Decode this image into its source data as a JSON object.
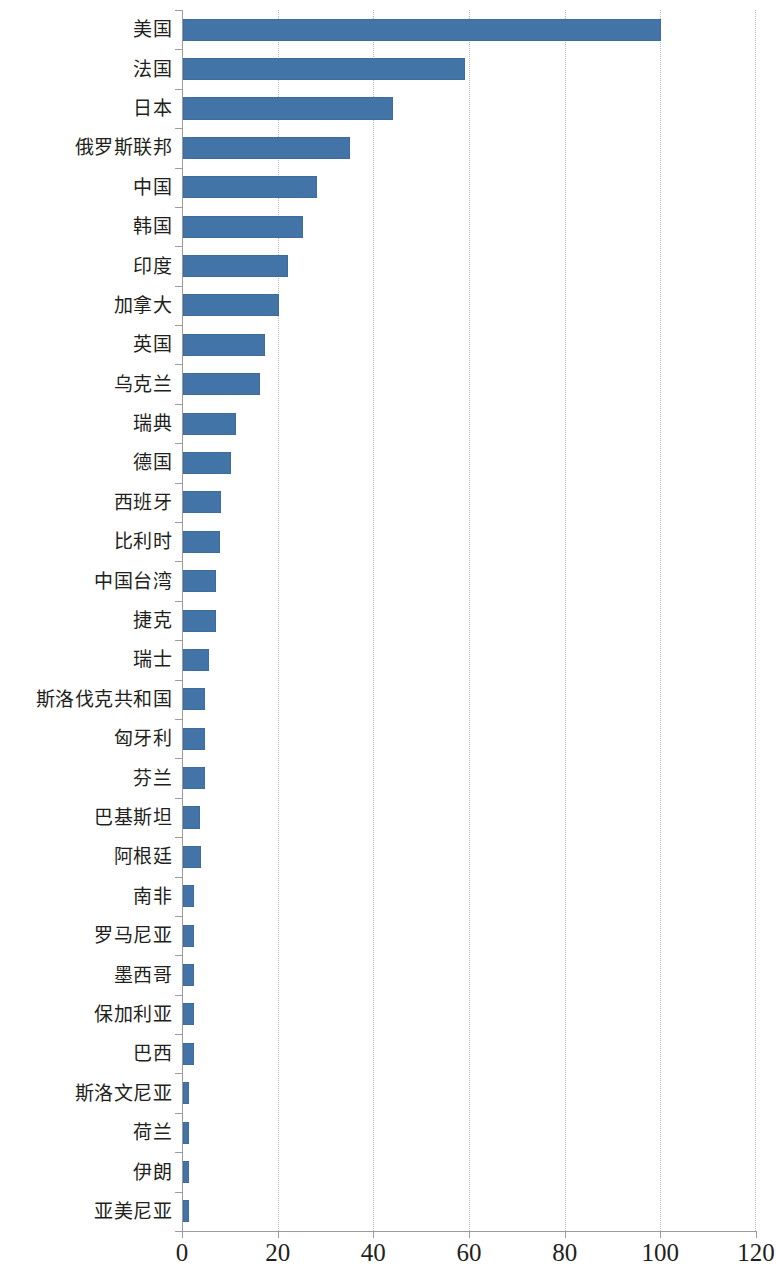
{
  "chart_data": {
    "type": "bar",
    "orientation": "horizontal",
    "title": "",
    "subtitle": "",
    "xlabel": "",
    "ylabel": "",
    "xlim": [
      0,
      120
    ],
    "xticks": [
      0,
      20,
      40,
      60,
      80,
      100,
      120
    ],
    "xtick_labels": [
      "0",
      "20",
      "40",
      "60",
      "80",
      "100",
      "120"
    ],
    "grid": "vertical-dotted",
    "legend": "none",
    "series_color": "#4274a7",
    "categories": [
      "美国",
      "法国",
      "日本",
      "俄罗斯联邦",
      "中国",
      "韩国",
      "印度",
      "加拿大",
      "英国",
      "乌克兰",
      "瑞典",
      "德国",
      "西班牙",
      "比利时",
      "中国台湾",
      "捷克",
      "瑞士",
      "斯洛伐克共和国",
      "匈牙利",
      "芬兰",
      "巴基斯坦",
      "阿根廷",
      "南非",
      "罗马尼亚",
      "墨西哥",
      "保加利亚",
      "巴西",
      "斯洛文尼亚",
      "荷兰",
      "伊朗",
      "亚美尼亚"
    ],
    "values": [
      100,
      59,
      44,
      35,
      28,
      25,
      22,
      20,
      17.2,
      16.1,
      11,
      10,
      7.9,
      7.8,
      6.9,
      6.8,
      5.5,
      4.7,
      4.6,
      4.5,
      3.6,
      3.7,
      2.4,
      2.2,
      2.2,
      2.4,
      2.2,
      1.3,
      1.2,
      1.3,
      1.2
    ]
  }
}
